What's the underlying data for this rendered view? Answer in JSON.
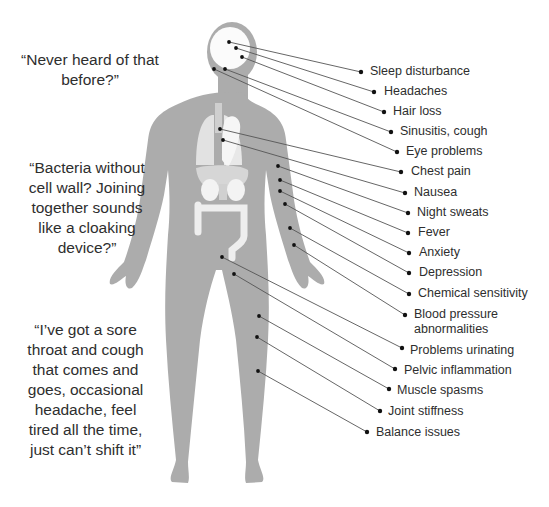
{
  "figure": {
    "body_color": "#acacac",
    "organ_color": "#e6e6e6",
    "organ_highlight": "#f7f7f7",
    "line_color": "#555555",
    "dot_color": "#111111"
  },
  "quotes": [
    {
      "id": "never-heard",
      "text": "“Never heard of that before?”",
      "x": 20,
      "y": 50,
      "w": 140
    },
    {
      "id": "bacteria",
      "text": "“Bacteria without cell wall? Joining together sounds like a cloaking device?”",
      "x": 22,
      "y": 158,
      "w": 130
    },
    {
      "id": "sore-throat",
      "text": "“I’ve got a sore throat and cough that comes and goes, occasional headache, feel tired all the time, just can’t shift it”",
      "x": 18,
      "y": 320,
      "w": 135
    }
  ],
  "symptoms": [
    {
      "label": "Sleep disturbance",
      "from": [
        229,
        42
      ],
      "to": [
        361,
        72
      ],
      "tx": 370,
      "ty": 64
    },
    {
      "label": "Headaches",
      "from": [
        236,
        48
      ],
      "to": [
        374,
        92
      ],
      "tx": 384,
      "ty": 84
    },
    {
      "label": "Hair loss",
      "from": [
        242,
        57
      ],
      "to": [
        384,
        112
      ],
      "tx": 393,
      "ty": 104
    },
    {
      "label": "Sinusitis, cough",
      "from": [
        225,
        69
      ],
      "to": [
        391,
        132
      ],
      "tx": 400,
      "ty": 124
    },
    {
      "label": "Eye problems",
      "from": [
        214,
        69
      ],
      "to": [
        397,
        152
      ],
      "tx": 406,
      "ty": 144
    },
    {
      "label": "Chest pain",
      "from": [
        220,
        129
      ],
      "to": [
        401,
        172
      ],
      "tx": 411,
      "ty": 164
    },
    {
      "label": "Nausea",
      "from": [
        223,
        140
      ],
      "to": [
        405,
        193
      ],
      "tx": 414,
      "ty": 185
    },
    {
      "label": "Night sweats",
      "from": [
        278,
        166
      ],
      "to": [
        408,
        213
      ],
      "tx": 417,
      "ty": 205
    },
    {
      "label": "Fever",
      "from": [
        280,
        180
      ],
      "to": [
        408,
        233
      ],
      "tx": 418,
      "ty": 225
    },
    {
      "label": "Anxiety",
      "from": [
        280,
        191
      ],
      "to": [
        409,
        253
      ],
      "tx": 419,
      "ty": 245
    },
    {
      "label": "Depression",
      "from": [
        285,
        204
      ],
      "to": [
        409,
        273
      ],
      "tx": 419,
      "ty": 265
    },
    {
      "label": "Chemical sensitivity",
      "from": [
        290,
        228
      ],
      "to": [
        409,
        294
      ],
      "tx": 418,
      "ty": 286
    },
    {
      "label": "Blood pressure abnormalities",
      "from": [
        294,
        245
      ],
      "to": [
        405,
        315
      ],
      "tx": 414,
      "ty": 307,
      "multi": true
    },
    {
      "label": "Problems urinating",
      "from": [
        222,
        257
      ],
      "to": [
        402,
        348
      ],
      "tx": 410,
      "ty": 343
    },
    {
      "label": "Pelvic inflammation",
      "from": [
        234,
        274
      ],
      "to": [
        395,
        369
      ],
      "tx": 404,
      "ty": 363
    },
    {
      "label": "Muscle spasms",
      "from": [
        259,
        316
      ],
      "to": [
        389,
        389
      ],
      "tx": 397,
      "ty": 383
    },
    {
      "label": "Joint stiffness",
      "from": [
        257,
        337
      ],
      "to": [
        380,
        411
      ],
      "tx": 388,
      "ty": 404
    },
    {
      "label": "Balance issues",
      "from": [
        258,
        371
      ],
      "to": [
        367,
        432
      ],
      "tx": 376,
      "ty": 425
    }
  ]
}
